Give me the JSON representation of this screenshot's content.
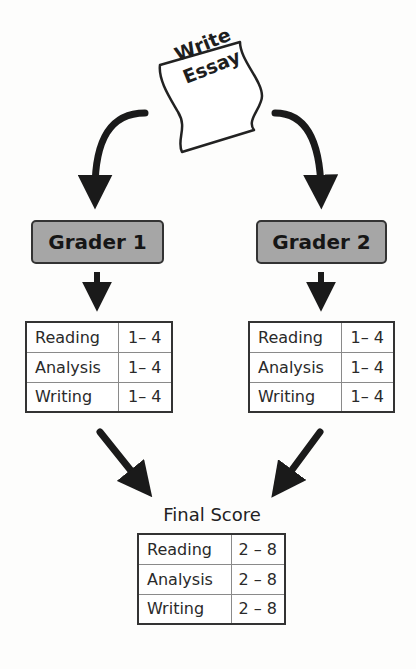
{
  "start": {
    "label_line1": "Write",
    "label_line2": "Essay",
    "icon": "paper-sheet-icon"
  },
  "graders": [
    {
      "label": "Grader 1",
      "rows": [
        {
          "criterion": "Reading",
          "range": "1– 4"
        },
        {
          "criterion": "Analysis",
          "range": "1– 4"
        },
        {
          "criterion": "Writing",
          "range": "1– 4"
        }
      ]
    },
    {
      "label": "Grader 2",
      "rows": [
        {
          "criterion": "Reading",
          "range": "1– 4"
        },
        {
          "criterion": "Analysis",
          "range": "1– 4"
        },
        {
          "criterion": "Writing",
          "range": "1– 4"
        }
      ]
    }
  ],
  "final": {
    "title": "Final Score",
    "rows": [
      {
        "criterion": "Reading",
        "range": "2 – 8"
      },
      {
        "criterion": "Analysis",
        "range": "2 – 8"
      },
      {
        "criterion": "Writing",
        "range": "2 – 8"
      }
    ]
  },
  "colors": {
    "grader_fill": "#a6a6a6",
    "stroke": "#222222",
    "background": "#fdfdfc"
  }
}
